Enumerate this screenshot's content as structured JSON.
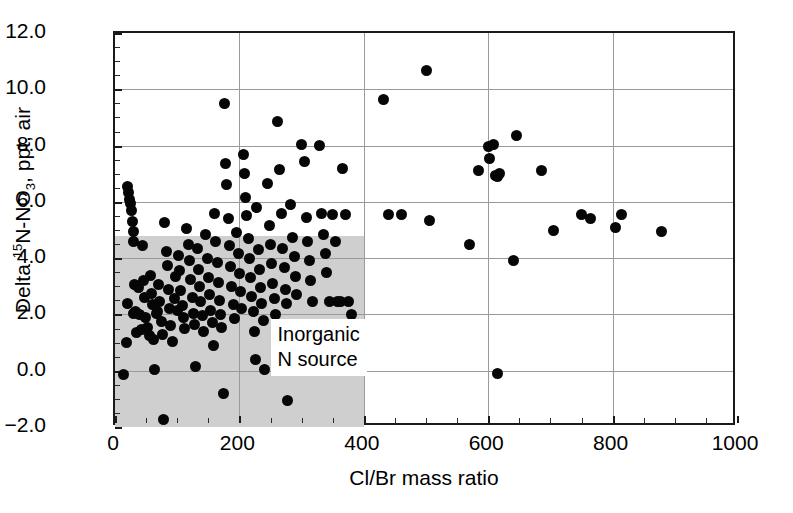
{
  "chart_data": {
    "type": "scatter",
    "title": "",
    "xlabel": "Cl/Br mass ratio",
    "ylabel_plain": "Delta 15N-NO3, ppt, air",
    "ylabel_parts": {
      "prefix": "Delta ",
      "sup": "15",
      "mid": "N-NO",
      "sub": "3",
      "suffix": ", ppt, air"
    },
    "xlim": [
      0,
      1000
    ],
    "ylim": [
      -2.0,
      12.0
    ],
    "xticks": [
      0,
      200,
      400,
      600,
      800,
      1000
    ],
    "xtick_labels": [
      "0",
      "200",
      "400",
      "600",
      "800",
      "1000"
    ],
    "yticks": [
      -2.0,
      0.0,
      2.0,
      4.0,
      6.0,
      8.0,
      10.0,
      12.0
    ],
    "ytick_labels": [
      "-2.0",
      "0.0",
      "2.0",
      "4.0",
      "6.0",
      "8.0",
      "10.0",
      "12.0"
    ],
    "x_minor_interval": 50,
    "y_minor_interval": 0.5,
    "grid": "both-major-lines",
    "legend": "none",
    "marker": {
      "shape": "circle",
      "color": "#060606",
      "size_px": 11
    },
    "annotations": [
      {
        "type": "shaded-rectangle",
        "name": "inorganic-n-source-region",
        "x_range": [
          0,
          400
        ],
        "y_range": [
          -2.0,
          4.8
        ],
        "color": "#cfcfcf"
      },
      {
        "type": "text",
        "name": "inorganic-n-source-label",
        "text_line1": "Inorganic",
        "text_line2": "N source",
        "x": 250,
        "y": 0.85,
        "background": "#ffffff"
      }
    ],
    "points": [
      [
        14,
        -0.15
      ],
      [
        18,
        1.0
      ],
      [
        20,
        2.4
      ],
      [
        20,
        6.55
      ],
      [
        22,
        6.35
      ],
      [
        24,
        6.1
      ],
      [
        25,
        5.95
      ],
      [
        27,
        5.7
      ],
      [
        28,
        5.3
      ],
      [
        29,
        4.95
      ],
      [
        30,
        4.6
      ],
      [
        32,
        3.05
      ],
      [
        30,
        2.05
      ],
      [
        33,
        2.1
      ],
      [
        35,
        1.35
      ],
      [
        38,
        2.95
      ],
      [
        40,
        2.0
      ],
      [
        42,
        1.45
      ],
      [
        45,
        4.45
      ],
      [
        46,
        3.2
      ],
      [
        48,
        2.6
      ],
      [
        49,
        1.9
      ],
      [
        52,
        1.55
      ],
      [
        55,
        1.25
      ],
      [
        57,
        3.4
      ],
      [
        58,
        2.75
      ],
      [
        60,
        2.35
      ],
      [
        62,
        1.1
      ],
      [
        64,
        0.05
      ],
      [
        66,
        2.05
      ],
      [
        68,
        2.1
      ],
      [
        70,
        3.05
      ],
      [
        72,
        2.45
      ],
      [
        74,
        1.75
      ],
      [
        76,
        1.3
      ],
      [
        78,
        -1.75
      ],
      [
        80,
        5.25
      ],
      [
        82,
        4.25
      ],
      [
        84,
        3.75
      ],
      [
        86,
        2.9
      ],
      [
        88,
        2.2
      ],
      [
        90,
        1.6
      ],
      [
        92,
        1.05
      ],
      [
        95,
        2.55
      ],
      [
        98,
        3.35
      ],
      [
        100,
        2.15
      ],
      [
        102,
        4.1
      ],
      [
        104,
        3.55
      ],
      [
        106,
        2.85
      ],
      [
        108,
        2.3
      ],
      [
        110,
        1.9
      ],
      [
        112,
        1.5
      ],
      [
        115,
        5.05
      ],
      [
        118,
        4.5
      ],
      [
        120,
        3.9
      ],
      [
        122,
        3.25
      ],
      [
        124,
        2.6
      ],
      [
        126,
        2.05
      ],
      [
        128,
        1.65
      ],
      [
        130,
        0.15
      ],
      [
        132,
        4.35
      ],
      [
        134,
        3.6
      ],
      [
        136,
        3.0
      ],
      [
        138,
        2.45
      ],
      [
        140,
        1.95
      ],
      [
        142,
        1.4
      ],
      [
        145,
        4.85
      ],
      [
        148,
        4.0
      ],
      [
        150,
        3.3
      ],
      [
        152,
        2.7
      ],
      [
        154,
        2.15
      ],
      [
        156,
        1.7
      ],
      [
        158,
        0.9
      ],
      [
        160,
        5.6
      ],
      [
        162,
        4.6
      ],
      [
        164,
        3.85
      ],
      [
        166,
        3.15
      ],
      [
        168,
        2.5
      ],
      [
        170,
        2.0
      ],
      [
        172,
        1.55
      ],
      [
        174,
        -0.8
      ],
      [
        176,
        9.5
      ],
      [
        178,
        7.35
      ],
      [
        180,
        6.6
      ],
      [
        182,
        5.4
      ],
      [
        184,
        4.45
      ],
      [
        186,
        3.7
      ],
      [
        188,
        3.0
      ],
      [
        190,
        2.35
      ],
      [
        192,
        1.85
      ],
      [
        195,
        4.9
      ],
      [
        198,
        4.15
      ],
      [
        200,
        3.45
      ],
      [
        202,
        2.8
      ],
      [
        204,
        2.2
      ],
      [
        206,
        7.7
      ],
      [
        208,
        7.0
      ],
      [
        210,
        6.15
      ],
      [
        212,
        5.5
      ],
      [
        214,
        4.7
      ],
      [
        216,
        4.0
      ],
      [
        218,
        3.3
      ],
      [
        220,
        2.65
      ],
      [
        222,
        2.1
      ],
      [
        224,
        1.4
      ],
      [
        226,
        0.4
      ],
      [
        228,
        5.8
      ],
      [
        230,
        4.3
      ],
      [
        232,
        3.6
      ],
      [
        234,
        2.95
      ],
      [
        236,
        2.4
      ],
      [
        238,
        1.8
      ],
      [
        240,
        0.05
      ],
      [
        245,
        6.65
      ],
      [
        248,
        5.15
      ],
      [
        250,
        4.5
      ],
      [
        252,
        3.8
      ],
      [
        254,
        3.1
      ],
      [
        256,
        2.55
      ],
      [
        258,
        2.0
      ],
      [
        262,
        8.85
      ],
      [
        265,
        7.15
      ],
      [
        268,
        5.6
      ],
      [
        270,
        4.35
      ],
      [
        272,
        3.65
      ],
      [
        274,
        2.9
      ],
      [
        276,
        2.4
      ],
      [
        278,
        -1.05
      ],
      [
        282,
        5.9
      ],
      [
        285,
        4.75
      ],
      [
        288,
        4.05
      ],
      [
        290,
        3.35
      ],
      [
        292,
        2.7
      ],
      [
        295,
        1.1
      ],
      [
        300,
        8.05
      ],
      [
        305,
        7.45
      ],
      [
        308,
        5.45
      ],
      [
        310,
        4.6
      ],
      [
        312,
        3.9
      ],
      [
        315,
        3.2
      ],
      [
        318,
        2.45
      ],
      [
        322,
        0.55
      ],
      [
        328,
        8.0
      ],
      [
        332,
        5.6
      ],
      [
        335,
        4.85
      ],
      [
        338,
        4.15
      ],
      [
        340,
        3.5
      ],
      [
        345,
        2.45
      ],
      [
        350,
        5.55
      ],
      [
        355,
        4.6
      ],
      [
        358,
        2.45
      ],
      [
        362,
        2.45
      ],
      [
        365,
        7.2
      ],
      [
        370,
        5.55
      ],
      [
        375,
        2.45
      ],
      [
        380,
        2.0
      ],
      [
        432,
        9.65
      ],
      [
        440,
        5.55
      ],
      [
        460,
        5.55
      ],
      [
        500,
        10.65
      ],
      [
        505,
        5.35
      ],
      [
        570,
        4.5
      ],
      [
        585,
        7.1
      ],
      [
        600,
        7.95
      ],
      [
        602,
        7.55
      ],
      [
        608,
        8.05
      ],
      [
        612,
        6.95
      ],
      [
        615,
        6.9
      ],
      [
        618,
        7.0
      ],
      [
        615,
        -0.1
      ],
      [
        640,
        3.9
      ],
      [
        645,
        8.35
      ],
      [
        685,
        7.1
      ],
      [
        705,
        5.0
      ],
      [
        750,
        5.55
      ],
      [
        765,
        5.4
      ],
      [
        805,
        5.1
      ],
      [
        815,
        5.55
      ],
      [
        878,
        4.95
      ]
    ]
  }
}
